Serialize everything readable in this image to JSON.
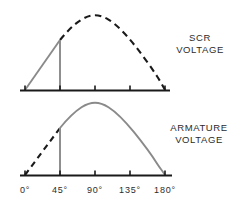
{
  "figure": {
    "background_color": "#ffffff"
  },
  "labels": {
    "scr": {
      "line1": "SCR",
      "line2": "VOLTAGE"
    },
    "armature": {
      "line1": "ARMATURE",
      "line2": "VOLTAGE"
    }
  },
  "axis": {
    "tick_labels": [
      "0°",
      "45°",
      "90°",
      "135°",
      "180°"
    ],
    "tick_values": [
      0,
      45,
      90,
      135,
      180
    ],
    "x_positions": [
      25,
      60,
      95,
      130,
      165
    ],
    "unit": "degrees",
    "axis_color": "#1a1a1a",
    "tick_color": "#1a1a1a"
  },
  "colors": {
    "curve_solid": "#8a8a8a",
    "curve_dashed": "#1a1a1a",
    "baseline": "#1a1a1a",
    "text": "#2b2b2b"
  },
  "chart_data": {
    "type": "line",
    "xlabel": "",
    "ylabel": "",
    "xlim": [
      0,
      180
    ],
    "x_tick_labels": [
      "0°",
      "45°",
      "90°",
      "135°",
      "180°"
    ],
    "x_ticks": [
      0,
      45,
      90,
      135,
      180
    ],
    "grid": false,
    "legend_position": "right",
    "firing_angle_deg": 45,
    "panels": [
      {
        "name": "SCR VOLTAGE",
        "label_position": "right",
        "ylim": [
          0,
          1
        ],
        "series": [
          {
            "name": "scr-conducting-ramp",
            "style": "solid",
            "color": "#8a8a8a",
            "description": "rising ramp from 0° baseline to sine value at 45° firing point",
            "x": [
              0,
              45
            ],
            "y": [
              0.0,
              0.707
            ]
          },
          {
            "name": "scr-firing-drop",
            "style": "solid",
            "color": "#8a8a8a",
            "description": "vertical collapse to zero at 45° firing angle",
            "x": [
              45,
              45
            ],
            "y": [
              0.707,
              0.0
            ]
          },
          {
            "name": "scr-blocked-sine",
            "style": "dashed",
            "color": "#1a1a1a",
            "description": "dashed half sine showing blocked supply voltage after firing",
            "x": [
              45,
              60,
              75,
              90,
              105,
              120,
              135,
              150,
              165,
              180
            ],
            "y": [
              0.707,
              0.866,
              0.966,
              1.0,
              0.966,
              0.866,
              0.707,
              0.5,
              0.259,
              0.0
            ]
          }
        ]
      },
      {
        "name": "ARMATURE VOLTAGE",
        "label_position": "right",
        "ylim": [
          0,
          1
        ],
        "series": [
          {
            "name": "armature-blocked-sine",
            "style": "dashed",
            "color": "#1a1a1a",
            "description": "dashed ramp from 0° to firing point, no armature voltage yet",
            "x": [
              0,
              45
            ],
            "y": [
              0.0,
              0.707
            ]
          },
          {
            "name": "armature-firing-rise",
            "style": "solid",
            "color": "#8a8a8a",
            "description": "vertical step up at 45° firing angle",
            "x": [
              45,
              45
            ],
            "y": [
              0.0,
              0.707
            ]
          },
          {
            "name": "armature-conducting-sine",
            "style": "solid",
            "color": "#8a8a8a",
            "description": "solid half sine of conducting armature voltage",
            "x": [
              45,
              60,
              75,
              90,
              105,
              120,
              135,
              150,
              165,
              180
            ],
            "y": [
              0.707,
              0.866,
              0.966,
              1.0,
              0.966,
              0.866,
              0.707,
              0.5,
              0.259,
              0.0
            ]
          }
        ]
      }
    ]
  }
}
